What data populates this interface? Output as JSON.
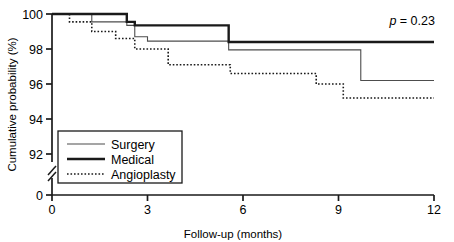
{
  "chart_data": {
    "type": "line",
    "subtype": "kaplan-meier-step",
    "title": "",
    "xlabel": "Follow-up (months)",
    "ylabel": "Cumulative probability (%)",
    "xlim": [
      0,
      12
    ],
    "ylim": [
      92,
      100
    ],
    "y_axis_break": true,
    "y_axis_break_note": "axis broken between 92 and 0",
    "grid": false,
    "xticks": [
      0,
      3,
      6,
      9,
      12
    ],
    "xtick_labels": [
      "0",
      "3",
      "6",
      "9",
      "12"
    ],
    "yticks": [
      100,
      98,
      96,
      94,
      92,
      0
    ],
    "ytick_labels": [
      "100",
      "98",
      "96",
      "94",
      "92",
      "0"
    ],
    "annotations": [
      {
        "name": "p-value",
        "italic_prefix": "p",
        "text": " = 0.23",
        "full_text": "p = 0.23",
        "x": 10.6,
        "y": 99.6
      }
    ],
    "legend": {
      "position": "bottom-left-inset",
      "entries": [
        {
          "label": "Surgery",
          "style": "solid-thin",
          "color": "#4d4d4d",
          "width": 1.1
        },
        {
          "label": "Medical",
          "style": "solid-thick",
          "color": "#1a1a1a",
          "width": 2.4
        },
        {
          "label": "Angioplasty",
          "style": "dotted",
          "color": "#1a1a1a",
          "width": 1.6
        }
      ]
    },
    "series": [
      {
        "name": "Surgery",
        "style": "solid-thin",
        "points": [
          {
            "x": 0.0,
            "y": 100.0
          },
          {
            "x": 1.25,
            "y": 100.0
          },
          {
            "x": 1.25,
            "y": 99.55
          },
          {
            "x": 2.35,
            "y": 99.55
          },
          {
            "x": 2.35,
            "y": 99.35
          },
          {
            "x": 2.6,
            "y": 99.35
          },
          {
            "x": 2.6,
            "y": 98.7
          },
          {
            "x": 3.0,
            "y": 98.7
          },
          {
            "x": 3.0,
            "y": 98.45
          },
          {
            "x": 5.55,
            "y": 98.45
          },
          {
            "x": 5.55,
            "y": 97.95
          },
          {
            "x": 9.7,
            "y": 97.95
          },
          {
            "x": 9.7,
            "y": 96.2
          },
          {
            "x": 12.0,
            "y": 96.2
          }
        ]
      },
      {
        "name": "Medical",
        "style": "solid-thick",
        "points": [
          {
            "x": 0.0,
            "y": 100.0
          },
          {
            "x": 2.35,
            "y": 100.0
          },
          {
            "x": 2.35,
            "y": 99.55
          },
          {
            "x": 2.6,
            "y": 99.55
          },
          {
            "x": 2.6,
            "y": 99.35
          },
          {
            "x": 5.55,
            "y": 99.35
          },
          {
            "x": 5.55,
            "y": 98.4
          },
          {
            "x": 12.0,
            "y": 98.4
          }
        ]
      },
      {
        "name": "Angioplasty",
        "style": "dotted",
        "points": [
          {
            "x": 0.0,
            "y": 100.0
          },
          {
            "x": 0.55,
            "y": 100.0
          },
          {
            "x": 0.55,
            "y": 99.55
          },
          {
            "x": 1.25,
            "y": 99.55
          },
          {
            "x": 1.25,
            "y": 99.0
          },
          {
            "x": 2.0,
            "y": 99.0
          },
          {
            "x": 2.0,
            "y": 98.6
          },
          {
            "x": 2.6,
            "y": 98.6
          },
          {
            "x": 2.6,
            "y": 98.0
          },
          {
            "x": 3.65,
            "y": 98.0
          },
          {
            "x": 3.65,
            "y": 97.1
          },
          {
            "x": 5.6,
            "y": 97.1
          },
          {
            "x": 5.6,
            "y": 96.6
          },
          {
            "x": 8.3,
            "y": 96.6
          },
          {
            "x": 8.3,
            "y": 96.0
          },
          {
            "x": 9.15,
            "y": 96.0
          },
          {
            "x": 9.15,
            "y": 95.2
          },
          {
            "x": 12.0,
            "y": 95.2
          }
        ]
      }
    ]
  },
  "colors": {
    "axis": "#1a1a1a",
    "surgery": "#4d4d4d",
    "medical": "#1a1a1a",
    "angioplasty": "#1a1a1a",
    "background": "#ffffff",
    "legend_border": "#1a1a1a"
  }
}
